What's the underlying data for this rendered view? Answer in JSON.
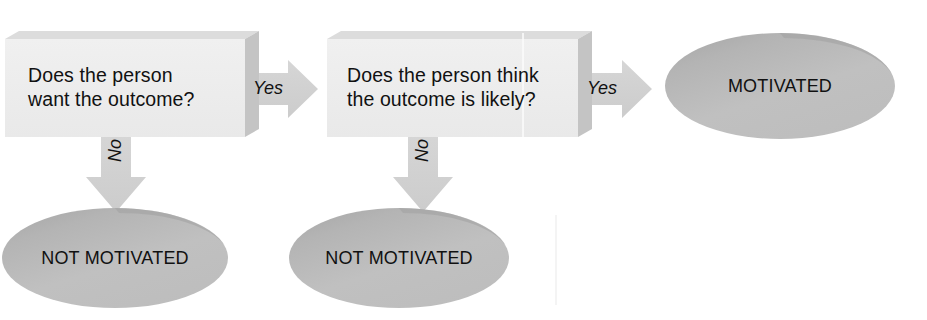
{
  "diagram": {
    "type": "flowchart",
    "title": "",
    "orientation": "left-to-right with downward branches",
    "colors": {
      "box_fill": "#eeeeee",
      "box_top_bevel": "#d8d8d8",
      "box_side_bevel": "#c6c6c6",
      "ellipse_fill": "#bdbdbd",
      "ellipse_shade": "#a6a6a6",
      "arrow_fill": "#d2d2d2",
      "text": "#111111",
      "background": "#ffffff"
    },
    "nodes": [
      {
        "id": "q1",
        "shape": "box-3d",
        "lines": [
          "Does the person",
          "want the outcome?"
        ]
      },
      {
        "id": "q2",
        "shape": "box-3d",
        "lines": [
          "Does the person think",
          "the outcome is likely?"
        ]
      },
      {
        "id": "motivated",
        "shape": "ellipse",
        "label": "MOTIVATED"
      },
      {
        "id": "not_motivated_1",
        "shape": "ellipse",
        "label": "NOT MOTIVATED"
      },
      {
        "id": "not_motivated_2",
        "shape": "ellipse",
        "label": "NOT MOTIVATED"
      }
    ],
    "edges": [
      {
        "id": "e1",
        "from": "q1",
        "to": "q2",
        "label": "Yes",
        "direction": "right"
      },
      {
        "id": "e2",
        "from": "q1",
        "to": "not_motivated_1",
        "label": "No",
        "direction": "down"
      },
      {
        "id": "e3",
        "from": "q2",
        "to": "motivated",
        "label": "Yes",
        "direction": "right"
      },
      {
        "id": "e4",
        "from": "q2",
        "to": "not_motivated_2",
        "label": "No",
        "direction": "down"
      }
    ]
  }
}
